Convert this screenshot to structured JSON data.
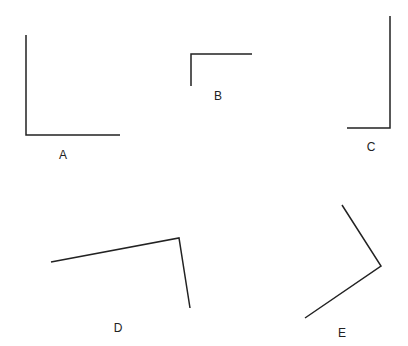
{
  "diagram": {
    "stroke_color": "#222222",
    "stroke_width": 1.5,
    "angles": [
      {
        "label": "A",
        "points": [
          [
            26,
            35
          ],
          [
            26,
            135
          ],
          [
            120,
            135
          ]
        ],
        "label_pos": [
          63,
          155
        ]
      },
      {
        "label": "B",
        "points": [
          [
            191,
            86
          ],
          [
            191,
            54
          ],
          [
            252,
            54
          ]
        ],
        "label_pos": [
          218,
          96
        ]
      },
      {
        "label": "C",
        "points": [
          [
            390,
            16
          ],
          [
            390,
            128
          ],
          [
            347,
            128
          ]
        ],
        "label_pos": [
          371,
          147
        ]
      },
      {
        "label": "D",
        "points": [
          [
            51,
            262
          ],
          [
            179,
            238
          ],
          [
            190,
            308
          ]
        ],
        "label_pos": [
          118,
          328
        ]
      },
      {
        "label": "E",
        "points": [
          [
            342,
            205
          ],
          [
            381,
            266
          ],
          [
            305,
            318
          ]
        ],
        "label_pos": [
          342,
          333
        ]
      }
    ]
  }
}
